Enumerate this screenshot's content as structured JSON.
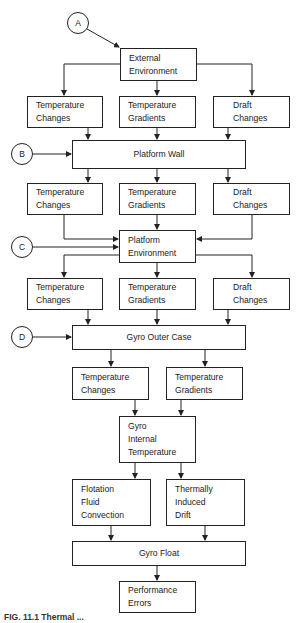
{
  "diagram": {
    "markers": [
      "A",
      "B",
      "C",
      "D"
    ],
    "nodes": {
      "external_environment": [
        "External",
        "Environment"
      ],
      "row1": {
        "temp_changes": [
          "Temperature",
          "Changes"
        ],
        "temp_gradients": [
          "Temperature",
          "Gradients"
        ],
        "draft_changes": [
          "Draft",
          "Changes"
        ]
      },
      "platform_wall": "Platform Wall",
      "row2": {
        "temp_changes": [
          "Temperature",
          "Changes"
        ],
        "temp_gradients": [
          "Temperature",
          "Gradients"
        ],
        "draft_changes": [
          "Draft",
          "Changes"
        ]
      },
      "platform_environment": [
        "Platform",
        "Environment"
      ],
      "row3": {
        "temp_changes": [
          "Temperature",
          "Changes"
        ],
        "temp_gradients": [
          "Temperature",
          "Gradients"
        ],
        "draft_changes": [
          "Draft",
          "Changes"
        ]
      },
      "gyro_outer_case": "Gyro Outer Case",
      "row4": {
        "temp_changes": [
          "Temperature",
          "Changes"
        ],
        "temp_gradients": [
          "Temperature",
          "Gradients"
        ]
      },
      "gyro_internal_temperature": [
        "Gyro",
        "Internal",
        "Temperature"
      ],
      "flotation_fluid_convection": [
        "Flotation",
        "Fluid",
        "Convection"
      ],
      "thermally_induced_drift": [
        "Thermally",
        "Induced",
        "Drift"
      ],
      "gyro_float": "Gyro Float",
      "performance_errors": [
        "Performance",
        "Errors"
      ]
    },
    "caption": "FIG. 11.1  Thermal ..."
  }
}
